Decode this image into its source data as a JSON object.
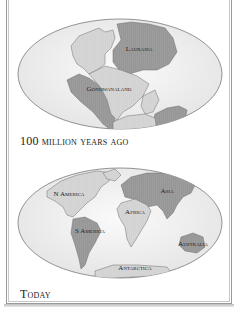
{
  "panels": [
    {
      "caption": "100 million years ago",
      "labels": {
        "laurasia": "Laurasia",
        "gondwanaland": "Gondwanaland"
      }
    },
    {
      "caption": "Today",
      "labels": {
        "north_america": "N America",
        "south_america": "S America",
        "africa": "Africa",
        "asia": "Asia",
        "australia": "Australia",
        "antarctica": "Antarctica"
      }
    }
  ],
  "colors": {
    "ocean": "#efefef",
    "land_light": "#d4d4d4",
    "land_dark": "#9c9c9c",
    "outline": "#7a7a7a",
    "frame": "#9a9a9a"
  }
}
